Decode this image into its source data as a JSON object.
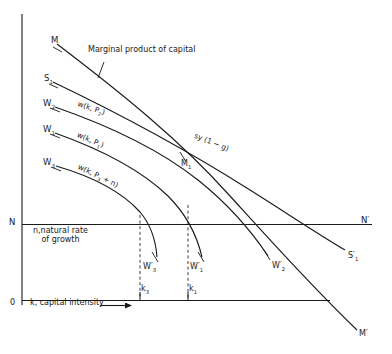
{
  "figure": {
    "type": "economics-line-diagram",
    "axes": {
      "y_axis_name": "vertical-axis",
      "x_axis_name": "horizontal-axis",
      "origin_label": "0",
      "x_axis_label": "k, capital intensity",
      "x_axis_arrow": "⟶",
      "n_level_label": "N",
      "n_level_label_right": "N′",
      "n_level_caption_line1": "n,natural rate",
      "n_level_caption_line2": "of growth"
    },
    "annotations": {
      "mpk_caption": "Marginal product of capital"
    },
    "curve_left_labels": {
      "M": "M",
      "S1": "S",
      "S1_sub": "1",
      "W2": "W",
      "W2_sub": "2",
      "W1": "W",
      "W1_sub": "1",
      "W3": "W",
      "W3_sub": "3"
    },
    "curve_right_labels": {
      "M_prime": "M′",
      "S1_prime": "S′",
      "S1_prime_sub": "1",
      "W1_prime": "W′",
      "W1_prime_sub": "1",
      "W2_prime": "W′",
      "W2_prime_sub": "2",
      "W3_prime": "W′",
      "W3_prime_sub": "3",
      "M1_mid": "M",
      "M1_mid_sub": "1"
    },
    "inline_curve_labels": {
      "w_k_r2": "w(k, P",
      "w_k_r2_sub": "2",
      "w_k_r2_end": ")",
      "w_k_r1": "w(k, P",
      "w_k_r1_sub": "1",
      "w_k_r1_end": ")",
      "w_k_r3": "w(k, P",
      "w_k_r3_sub": "3",
      "w_k_r3_end": " + n)",
      "saving": "sy (1 − g)"
    },
    "tick_labels": {
      "k3": "k",
      "k3_sub": "3",
      "k1": "k",
      "k1_sub": "1"
    },
    "colors": {
      "ink": "#1a1a1a",
      "paper": "#ffffff"
    }
  }
}
